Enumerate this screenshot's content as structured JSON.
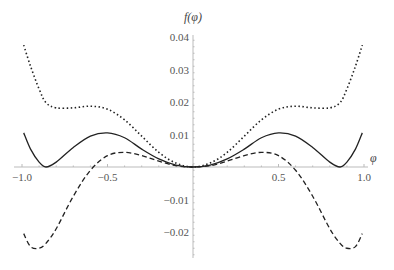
{
  "chart_data": {
    "type": "line",
    "title": "",
    "xlabel": "φ",
    "ylabel": "f(φ)",
    "xlim": [
      -1.0,
      1.0
    ],
    "ylim": [
      -0.028,
      0.04
    ],
    "grid": false,
    "legend": null,
    "x_ticks": [
      -1.0,
      -0.5,
      0.5,
      1.0
    ],
    "x_tick_labels": [
      "-1.0",
      "-0.5",
      "0.5",
      "1.0"
    ],
    "y_ticks": [
      0.04,
      0.03,
      0.02,
      0.01,
      -0.01,
      -0.02
    ],
    "y_tick_labels": [
      "0.04",
      "0.03",
      "0.02",
      "0.01",
      "-0.01",
      "-0.02"
    ],
    "x": [
      -0.99,
      -0.95,
      -0.9,
      -0.86,
      -0.8,
      -0.7,
      -0.6,
      -0.5,
      -0.4,
      -0.3,
      -0.2,
      -0.1,
      0,
      0.1,
      0.2,
      0.3,
      0.4,
      0.5,
      0.6,
      0.7,
      0.8,
      0.86,
      0.9,
      0.95,
      0.99
    ],
    "series": [
      {
        "name": "solid",
        "style": "solid",
        "values": [
          0.0105,
          0.0055,
          0.0015,
          0.0,
          0.0015,
          0.006,
          0.0095,
          0.0105,
          0.009,
          0.0055,
          0.0025,
          0.0006,
          0.0,
          0.0006,
          0.0025,
          0.0055,
          0.009,
          0.0105,
          0.0095,
          0.006,
          0.0015,
          0.0,
          0.0015,
          0.0055,
          0.0105
        ]
      },
      {
        "name": "dashed",
        "style": "dashed",
        "values": [
          -0.0205,
          -0.0245,
          -0.025,
          -0.0235,
          -0.019,
          -0.009,
          -0.001,
          0.0035,
          0.0045,
          0.0035,
          0.0018,
          0.0004,
          0.0,
          0.0004,
          0.0018,
          0.0035,
          0.0045,
          0.0035,
          -0.001,
          -0.009,
          -0.019,
          -0.0235,
          -0.025,
          -0.0245,
          -0.0205
        ]
      },
      {
        "name": "dotted",
        "style": "dotted",
        "values": [
          0.0375,
          0.031,
          0.024,
          0.0198,
          0.0182,
          0.0182,
          0.0187,
          0.0178,
          0.0145,
          0.0095,
          0.0045,
          0.0012,
          0.0,
          0.0012,
          0.0045,
          0.0095,
          0.0145,
          0.0178,
          0.0187,
          0.0182,
          0.0182,
          0.0198,
          0.024,
          0.031,
          0.0375
        ]
      }
    ]
  },
  "labels": {
    "y_axis": "f(φ)",
    "x_axis": "φ"
  }
}
